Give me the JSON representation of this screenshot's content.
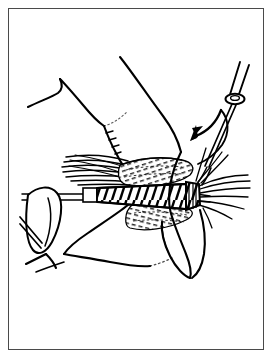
{
  "figure": {
    "title": "Fly tying step illustration",
    "caption": "",
    "domain": "line-art-instructional-diagram",
    "style": "black and white pen-and-ink line drawing",
    "background_color": "#ffffff",
    "ink_color": "#000000",
    "frame": {
      "present": true,
      "border_color": "#4a4a4a",
      "border_width_px": 1,
      "inset_px": 8
    }
  },
  "scene": {
    "subject": "artificial fishing fly held in a tying vise while thread is wrapped",
    "elements": [
      {
        "name": "hook-and-shank",
        "label": "Hook shank",
        "description": "straight double-line shank running horizontally, clamped at left by vise jaws"
      },
      {
        "name": "vise-jaws",
        "label": "Vise jaws",
        "description": "tapered clamp gripping the hook bend at lower left"
      },
      {
        "name": "fly-body",
        "label": "Fly body",
        "description": "diagonally hatched ribbed body wrapped along the shank"
      },
      {
        "name": "upper-wing",
        "label": "Upper wing",
        "description": "dashed cross-hatched wing sloping up and back"
      },
      {
        "name": "lower-wing",
        "label": "Lower wing",
        "description": "dashed cross-hatched wing sloping down and back"
      },
      {
        "name": "tail-fibers",
        "label": "Tail fibers",
        "description": "bundle of long curved fibers at the rear of the fly"
      },
      {
        "name": "hackle",
        "label": "Hackle",
        "description": "fanned fibers radiating from the head of the fly"
      },
      {
        "name": "thread-head",
        "label": "Thread head wraps",
        "description": "tight band of thread wraps forming the head"
      },
      {
        "name": "bobbin",
        "label": "Bobbin holder",
        "description": "thread bobbin tube with spool, held above and right of the fly"
      },
      {
        "name": "thread-line",
        "label": "Tying thread",
        "description": "thread running from the bobbin down to the head of the fly"
      },
      {
        "name": "upper-hand",
        "label": "Upper hand",
        "description": "outline of a hand and thumb reaching in from the top"
      },
      {
        "name": "lower-hand",
        "label": "Lower hand",
        "description": "outline of the other hand supporting from below"
      },
      {
        "name": "direction-arrow",
        "label": "Wrap direction arrow",
        "description": "curved arrow sweeping down and to the left showing thread wrap direction"
      }
    ]
  }
}
